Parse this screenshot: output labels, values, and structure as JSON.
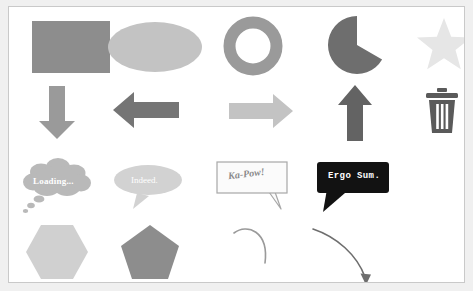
{
  "canvas": {
    "background": "#ffffff",
    "border_color": "#c9c9c9",
    "page_background": "#f0f0f0",
    "width": 473,
    "height": 291
  },
  "palette": {
    "gray_mid": "#8d8d8d",
    "gray_light": "#c3c3c3",
    "gray_lighter": "#d4d4d4",
    "gray_lightest": "#e6e6e6",
    "gray_dark": "#6e6e6e",
    "gray_darker": "#5f5f5f",
    "black": "#121212",
    "white": "#ffffff",
    "stroke_gray": "#9a9a9a"
  },
  "shapes": {
    "rows": [
      {
        "row_name": "basic-shapes",
        "items": [
          {
            "name": "rectangle",
            "label": "rectangle",
            "fill": "#8d8d8d",
            "text": ""
          },
          {
            "name": "ellipse",
            "label": "ellipse",
            "fill": "#c3c3c3",
            "text": ""
          },
          {
            "name": "donut",
            "label": "donut",
            "fill": "#9a9a9a",
            "text": ""
          },
          {
            "name": "pie",
            "label": "pie",
            "fill": "#6e6e6e",
            "text": ""
          },
          {
            "name": "star",
            "label": "star",
            "fill": "#e6e6e6",
            "text": ""
          }
        ]
      },
      {
        "row_name": "arrows-and-icons",
        "items": [
          {
            "name": "arrow-down",
            "label": "down arrow",
            "fill": "#9a9a9a",
            "text": ""
          },
          {
            "name": "arrow-left",
            "label": "left arrow",
            "fill": "#757575",
            "text": ""
          },
          {
            "name": "arrow-right",
            "label": "right arrow",
            "fill": "#c3c3c3",
            "text": ""
          },
          {
            "name": "arrow-up",
            "label": "up arrow",
            "fill": "#636363",
            "text": ""
          },
          {
            "name": "trash-can",
            "label": "trash can",
            "fill": "#5a5a5a",
            "text": ""
          }
        ]
      },
      {
        "row_name": "callouts",
        "items": [
          {
            "name": "thought-bubble",
            "label": "thought bubble",
            "fill": "#b9b9b9",
            "text": "Loading..."
          },
          {
            "name": "speech-oval",
            "label": "oval speech bubble",
            "fill": "#d2d2d2",
            "text": "Indeed."
          },
          {
            "name": "speech-rect",
            "label": "rectangular callout",
            "fill": "#fbfbfb",
            "text": "Ka-Pow!"
          },
          {
            "name": "speech-rect-dark",
            "label": "dark rounded callout",
            "fill": "#121212",
            "text": "Ergo Sum."
          },
          {
            "name": "empty-slot",
            "label": "",
            "fill": "",
            "text": ""
          }
        ]
      },
      {
        "row_name": "polygons-and-curves",
        "items": [
          {
            "name": "hexagon",
            "label": "hexagon",
            "fill": "#d0d0d0",
            "text": ""
          },
          {
            "name": "pentagon",
            "label": "pentagon",
            "fill": "#8d8d8d",
            "text": ""
          },
          {
            "name": "arc-curve",
            "label": "arc",
            "fill": "#9a9a9a",
            "text": ""
          },
          {
            "name": "curved-arrow",
            "label": "curved arrow",
            "fill": "#6e6e6e",
            "text": ""
          },
          {
            "name": "empty-slot",
            "label": "",
            "fill": "",
            "text": ""
          }
        ]
      }
    ]
  }
}
